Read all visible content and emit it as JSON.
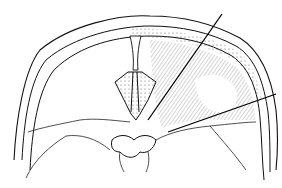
{
  "figure": {
    "type": "anatomical line drawing",
    "background": "#ffffff",
    "ink": "#111111",
    "leader_lines": [
      {
        "id": "upper",
        "from": [
          222,
          14
        ],
        "to": [
          148,
          120
        ]
      },
      {
        "id": "lower",
        "from": [
          276,
          94
        ],
        "to": [
          168,
          132
        ]
      }
    ]
  }
}
